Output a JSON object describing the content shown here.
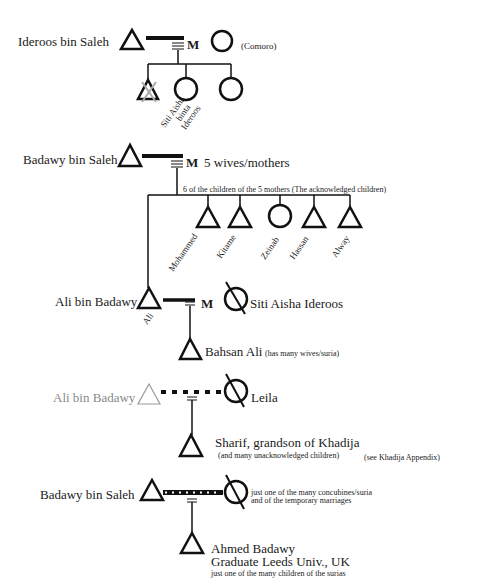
{
  "diagram": {
    "type": "kinship",
    "sections": [
      {
        "id": "ideroos",
        "father": "Ideroos bin Saleh",
        "marriage_marker": "M",
        "mother_note": "(Comoro)",
        "children": [
          "Siti Aisha binta Ideroos",
          "",
          ""
        ]
      },
      {
        "id": "badawy",
        "father": "Badawy bin Saleh",
        "marriage_marker": "M",
        "mother_note": "5 wives/mothers",
        "children_note": "6 of the children of the 5 mothers (The acknowledged children)",
        "children": [
          "Ali",
          "Mohammed",
          "Kitame",
          "Zeinab",
          "Hassan",
          "Alway"
        ]
      },
      {
        "id": "ali-aisha",
        "father": "Ali bin Badawy",
        "father_short": "Ali",
        "marriage_marker": "M",
        "mother": "Siti Aisha Ideroos",
        "child": "Bahsan Ali",
        "child_note": "(has many wives/suria)"
      },
      {
        "id": "ali-leila",
        "father": "Ali bin Badawy",
        "mother": "Leila",
        "child": "Sharif, grandson of Khadija",
        "child_note": "(and many unacknowledged children)",
        "appendix_note": "(see Khadija Appendix)"
      },
      {
        "id": "badawy-suria",
        "father": "Badawy bin Saleh",
        "mother_note_1": "just one of the many concubines/suria",
        "mother_note_2": "and of the temporary marriages",
        "child": "Ahmed Badawy",
        "child_line2": "Graduate Leeds Univ., UK",
        "child_line3": "just one of the many children of the surias"
      }
    ]
  },
  "labels": {
    "s1_father": "Ideroos bin Saleh",
    "s1_m": "M",
    "s1_mother": "(Comoro)",
    "s1_child1_a": "Siti Aisha",
    "s1_child1_b": "binta",
    "s1_child1_c": "Ideroos",
    "s2_father": "Badawy bin Saleh",
    "s2_m": "M",
    "s2_mother": "5 wives/mothers",
    "s2_note": "6 of the children of the 5 mothers (The acknowledged children)",
    "s2_c_mohammed": "Mohammed",
    "s2_c_kitame": "Kitame",
    "s2_c_zeinab": "Zeinab",
    "s2_c_hassan": "Hassan",
    "s2_c_alway": "Alway",
    "s3_father": "Ali bin Badawy",
    "s3_ali": "Ali",
    "s3_m": "M",
    "s3_mother": "Siti Aisha Ideroos",
    "s3_child": "Bahsan Ali",
    "s3_child_note": "(has many wives/suria)",
    "s4_father": "Ali bin Badawy",
    "s4_mother": "Leila",
    "s4_child": "Sharif, grandson of Khadija",
    "s4_child_note": "(and many unacknowledged children)",
    "s4_appendix": "(see Khadija Appendix)",
    "s5_father": "Badawy bin Saleh",
    "s5_mother_1": "just one of the many concubines/suria",
    "s5_mother_2": "and of the temporary marriages",
    "s5_child": "Ahmed Badawy",
    "s5_child_2": "Graduate Leeds Univ., UK",
    "s5_child_3": "just one of the many children of the surias"
  },
  "colors": {
    "ink": "#111111",
    "faded": "#8a8a8a",
    "background": "#ffffff"
  }
}
